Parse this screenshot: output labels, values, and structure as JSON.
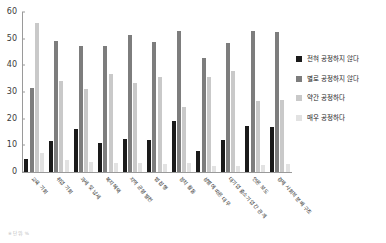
{
  "chart_data": {
    "type": "bar",
    "title": "",
    "xlabel": "",
    "ylabel": "",
    "ylim": [
      0,
      60
    ],
    "yticks": [
      0,
      10,
      20,
      30,
      40,
      50,
      60
    ],
    "grid": false,
    "legend_position": "right",
    "categories": [
      "교육 기회",
      "취업 기회",
      "과세 및 납세",
      "복지혜택",
      "지역 균형 발전",
      "법 집행",
      "정치 활동",
      "성별에 따른 대우",
      "대기업 중소기업 간 관계",
      "언론 보도",
      "경제 사회적 분배 구조"
    ],
    "series": [
      {
        "name": "전혀 공정하지 않다",
        "color": "#1a1a1a",
        "values": [
          5,
          11.5,
          16.3,
          11,
          12.2,
          12,
          19,
          8,
          12,
          17.3,
          17
        ]
      },
      {
        "name": "별로 공정하지 않다",
        "color": "#7d7d7d",
        "values": [
          31.6,
          49,
          47.3,
          47.4,
          51.5,
          48.6,
          52.7,
          42.7,
          48.3,
          53,
          52.5
        ]
      },
      {
        "name": "약간 공정하다",
        "color": "#c9c9c9",
        "values": [
          56,
          34.2,
          31.2,
          36.8,
          33.3,
          35.7,
          24.4,
          35.8,
          37.7,
          26.7,
          27
        ]
      },
      {
        "name": "매우 공정하다",
        "color": "#e2e2e2",
        "values": [
          7,
          4.5,
          3.8,
          3.5,
          3.2,
          2.9,
          3.5,
          2.4,
          2.1,
          2.8,
          2.9
        ]
      }
    ]
  },
  "legend": {
    "items": [
      {
        "label": "전혀 공정하지 않다",
        "color": "#1a1a1a"
      },
      {
        "label": "별로 공정하지 않다",
        "color": "#7d7d7d"
      },
      {
        "label": "약간 공정하다",
        "color": "#c9c9c9"
      },
      {
        "label": "매우 공정하다",
        "color": "#e2e2e2"
      }
    ]
  },
  "footnote": "※ 단위: %"
}
